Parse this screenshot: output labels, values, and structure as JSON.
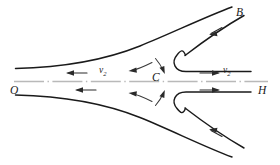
{
  "figure": {
    "background_color": "#ffffff",
    "line_color": "#1a1a1a",
    "axis_color": "#b9b9b9",
    "arrow_color": "#2a2a2a"
  },
  "labels": {
    "origin": "O",
    "right_end": "H",
    "upper_branch": "B",
    "center_point": "C",
    "velocity_left": "v",
    "velocity_left_sub": "2",
    "velocity_right": "v",
    "velocity_right_sub": "2"
  },
  "axis": {
    "name": "symmetry-axis",
    "style": "dash-dot",
    "from_label": "O",
    "to_label": "H"
  },
  "flow_arrows": [
    {
      "name": "inflow-upper-left",
      "direction": "left",
      "region": "upper-left"
    },
    {
      "name": "inflow-lower-left",
      "direction": "left",
      "region": "lower-left"
    },
    {
      "name": "outflow-upper-right",
      "direction": "right",
      "region": "upper-right"
    },
    {
      "name": "outflow-lower-right",
      "direction": "right",
      "region": "lower-right"
    },
    {
      "name": "inflow-upper-diagonal",
      "direction": "down-left",
      "region": "upper-right-diagonal"
    },
    {
      "name": "inflow-lower-diagonal",
      "direction": "up-left",
      "region": "lower-right-diagonal"
    }
  ],
  "curl_arrows": [
    {
      "name": "curl-upper-outward",
      "direction": "left"
    },
    {
      "name": "curl-upper-inward",
      "direction": "down-right"
    },
    {
      "name": "curl-lower-outward",
      "direction": "left"
    },
    {
      "name": "curl-lower-inward",
      "direction": "up-right"
    }
  ],
  "curves": [
    {
      "name": "separatrix-upper",
      "description": "upper separatrix rising to B"
    },
    {
      "name": "separatrix-lower",
      "description": "lower separatrix descending"
    },
    {
      "name": "hook-upper",
      "description": "upper U-turn field line"
    },
    {
      "name": "hook-lower",
      "description": "lower U-turn field line"
    },
    {
      "name": "branch-upper-outer",
      "description": "outer line toward B"
    },
    {
      "name": "branch-lower-outer",
      "description": "outer lower-right line"
    }
  ]
}
